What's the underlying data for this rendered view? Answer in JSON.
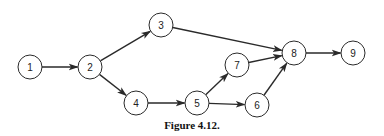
{
  "figure": {
    "caption": "Figure 4.12.",
    "node_radius": 12,
    "stroke_color": "#2a2a2a",
    "nodes": [
      {
        "id": "1",
        "label": "1",
        "x": 30,
        "y": 67
      },
      {
        "id": "2",
        "label": "2",
        "x": 90,
        "y": 67
      },
      {
        "id": "3",
        "label": "3",
        "x": 161,
        "y": 25
      },
      {
        "id": "4",
        "label": "4",
        "x": 136,
        "y": 103
      },
      {
        "id": "5",
        "label": "5",
        "x": 197,
        "y": 103
      },
      {
        "id": "6",
        "label": "6",
        "x": 257,
        "y": 105
      },
      {
        "id": "7",
        "label": "7",
        "x": 237,
        "y": 65
      },
      {
        "id": "8",
        "label": "8",
        "x": 294,
        "y": 53
      },
      {
        "id": "9",
        "label": "9",
        "x": 353,
        "y": 53
      }
    ],
    "edges": [
      {
        "from": "1",
        "to": "2"
      },
      {
        "from": "2",
        "to": "3"
      },
      {
        "from": "2",
        "to": "4"
      },
      {
        "from": "3",
        "to": "8"
      },
      {
        "from": "4",
        "to": "5"
      },
      {
        "from": "5",
        "to": "7"
      },
      {
        "from": "5",
        "to": "6"
      },
      {
        "from": "7",
        "to": "8"
      },
      {
        "from": "6",
        "to": "8"
      },
      {
        "from": "8",
        "to": "9"
      }
    ]
  }
}
